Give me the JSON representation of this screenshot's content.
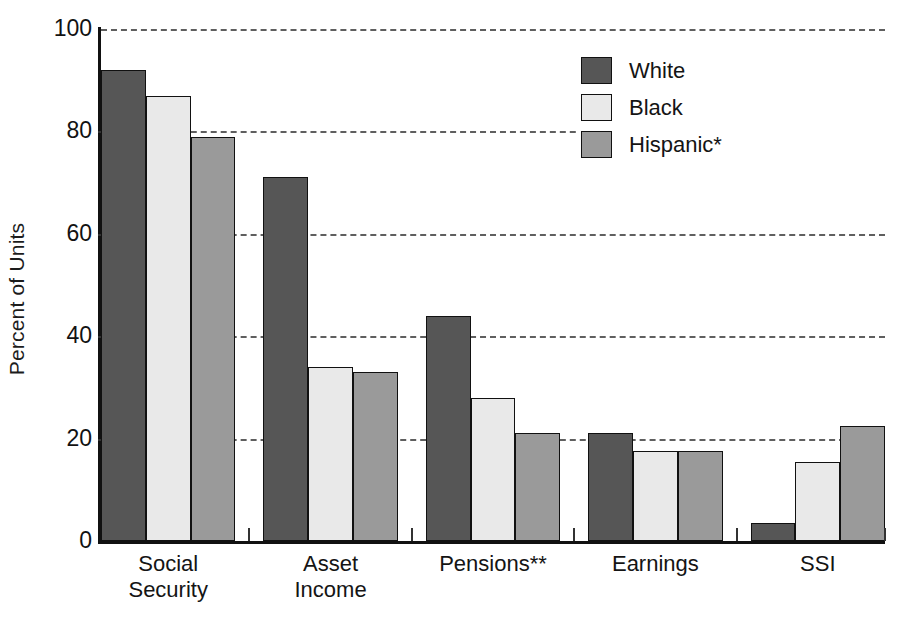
{
  "chart_data": {
    "type": "bar",
    "title": "",
    "xlabel": "",
    "ylabel": "Percent of Units",
    "ylim": [
      0,
      100
    ],
    "yticks": [
      0,
      20,
      40,
      60,
      80,
      100
    ],
    "ytick_labels": [
      "0",
      "20",
      "40",
      "60",
      "80",
      "100"
    ],
    "grid": "horizontal dashed gridlines at 20, 40, 60, 80, 100",
    "legend_position": "upper right inside plot area",
    "categories": [
      "Social Security",
      "Asset Income",
      "Pensions**",
      "Earnings",
      "SSI"
    ],
    "category_lines": [
      [
        "Social",
        "Security"
      ],
      [
        "Asset",
        "Income"
      ],
      [
        "Pensions**",
        ""
      ],
      [
        "Earnings",
        ""
      ],
      [
        "SSI",
        ""
      ]
    ],
    "series": [
      {
        "name": "White",
        "color": "#565656",
        "values": [
          92,
          71,
          44,
          21,
          3.5
        ]
      },
      {
        "name": "Black",
        "color": "#e9e9e9",
        "values": [
          87,
          34,
          28,
          17.5,
          15.5
        ]
      },
      {
        "name": "Hispanic*",
        "color": "#9a9a9a",
        "values": [
          79,
          33,
          21,
          17.5,
          22.5
        ]
      }
    ],
    "annotations": [
      "*",
      "**"
    ]
  },
  "legend": {
    "items": [
      {
        "label": "White",
        "swatch": "#565656"
      },
      {
        "label": "Black",
        "swatch": "#e9e9e9"
      },
      {
        "label": "Hispanic*",
        "swatch": "#9a9a9a"
      }
    ]
  },
  "axes": {
    "y_label": "Percent of Units",
    "y_ticks": [
      "100",
      "80",
      "60",
      "40",
      "20",
      "0"
    ]
  },
  "colors": {
    "white_series": "#565656",
    "black_series": "#e9e9e9",
    "hispanic_series": "#9a9a9a",
    "axis": "#111111",
    "grid": "#5f5f5f",
    "background": "#ffffff"
  }
}
